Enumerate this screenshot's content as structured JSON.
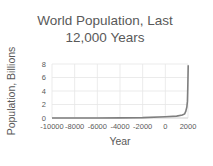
{
  "chart_data": {
    "type": "line",
    "title": "World Population, Last 12,000 Years",
    "title_lines": [
      "World Population, Last",
      "12,000 Years"
    ],
    "xlabel": "Year",
    "ylabel": "Population, Billions",
    "xlim": [
      -10000,
      2000
    ],
    "ylim": [
      0,
      8
    ],
    "x_ticks": [
      "-10000",
      "-8000",
      "-6000",
      "-4000",
      "-2000",
      "0",
      "2000"
    ],
    "y_ticks": [
      "0",
      "2",
      "4",
      "6",
      "8"
    ],
    "grid": true,
    "legend": null,
    "series": [
      {
        "name": "World Population",
        "color": "#7f7f7f",
        "x": [
          -10000,
          -8000,
          -6000,
          -4000,
          -2000,
          0,
          1000,
          1500,
          1700,
          1800,
          1900,
          1950,
          1980,
          2000,
          2020
        ],
        "values": [
          0.004,
          0.005,
          0.007,
          0.02,
          0.06,
          0.19,
          0.28,
          0.44,
          0.6,
          0.98,
          1.65,
          2.5,
          4.4,
          6.1,
          7.8
        ]
      }
    ]
  }
}
